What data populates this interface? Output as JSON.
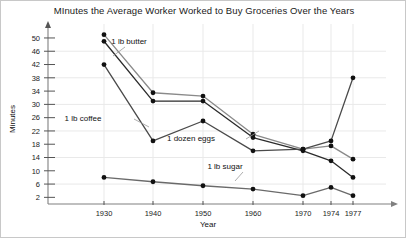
{
  "chart_data": {
    "type": "line",
    "title": "MInutes the Average Worker Worked to Buy Groceries Over the Years",
    "xlabel": "Year",
    "ylabel": "Minutes",
    "categories": [
      "1930",
      "1940",
      "1950",
      "1960",
      "1970",
      "1974",
      "1977"
    ],
    "x_tick_labels": [
      "1930",
      "1940",
      "1950",
      "1960",
      "1970",
      "1974",
      "1977"
    ],
    "y_tick_labels": [
      "2",
      "6",
      "10",
      "14",
      "18",
      "22",
      "26",
      "30",
      "34",
      "38",
      "42",
      "46",
      "50"
    ],
    "y_ticks": [
      2,
      6,
      10,
      14,
      18,
      22,
      26,
      30,
      34,
      38,
      42,
      46,
      50
    ],
    "ylim": [
      0,
      53
    ],
    "grid": true,
    "legend": "inline-annotations",
    "series": [
      {
        "name": "1 lb butter",
        "color": "#8a8a8a",
        "values": [
          51,
          33.5,
          32.5,
          21,
          16.5,
          17.5,
          13.5
        ]
      },
      {
        "name": "1 dozen eggs",
        "color": "#2b2b2b",
        "values": [
          49,
          31,
          31,
          20,
          16,
          13,
          8
        ]
      },
      {
        "name": "1 lb coffee",
        "color": "#4a4a4a",
        "values": [
          42,
          19,
          25,
          16,
          16.5,
          19,
          38
        ]
      },
      {
        "name": "1 lb sugar",
        "color": "#6a6a6a",
        "values": [
          8,
          6.7,
          5.5,
          4.5,
          2.5,
          5,
          2.5
        ]
      }
    ],
    "annotations": [
      {
        "text": "1 lb butter",
        "x": 128,
        "y": 43
      },
      {
        "text": "1 lb coffee",
        "x": 82,
        "y": 120
      },
      {
        "text": "1 dozen eggs",
        "x": 190,
        "y": 140
      },
      {
        "text": "1 lb sugar",
        "x": 224,
        "y": 168
      }
    ]
  }
}
